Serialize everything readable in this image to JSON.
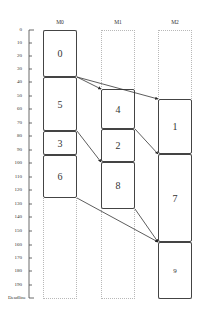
{
  "diagram": {
    "type": "schedule-gantt",
    "axis": {
      "ticks": [
        "0",
        "10",
        "20",
        "30",
        "40",
        "50",
        "60",
        "70",
        "80",
        "90",
        "100",
        "110",
        "120",
        "130",
        "140",
        "150",
        "160",
        "170",
        "180",
        "190"
      ],
      "end_label": "Deadline"
    },
    "columns": [
      {
        "id": "M0",
        "label": "M0"
      },
      {
        "id": "M1",
        "label": "M1"
      },
      {
        "id": "M2",
        "label": "M2"
      }
    ],
    "tasks": [
      {
        "id": "0",
        "label": "0",
        "machine": "M0"
      },
      {
        "id": "5",
        "label": "5",
        "machine": "M0"
      },
      {
        "id": "3",
        "label": "3",
        "machine": "M0"
      },
      {
        "id": "6",
        "label": "6",
        "machine": "M0"
      },
      {
        "id": "4",
        "label": "4",
        "machine": "M1"
      },
      {
        "id": "2",
        "label": "2",
        "machine": "M1"
      },
      {
        "id": "8",
        "label": "8",
        "machine": "M1"
      },
      {
        "id": "1",
        "label": "1",
        "machine": "M2"
      },
      {
        "id": "7",
        "label": "7",
        "machine": "M2"
      },
      {
        "id": "9",
        "label": "9",
        "machine": "M2"
      }
    ],
    "edges": [
      {
        "from": "0",
        "to": "4"
      },
      {
        "from": "0",
        "to": "1"
      },
      {
        "from": "5",
        "to": "8"
      },
      {
        "from": "4",
        "to": "7"
      },
      {
        "from": "6",
        "to": "9"
      },
      {
        "from": "8",
        "to": "9"
      }
    ]
  }
}
